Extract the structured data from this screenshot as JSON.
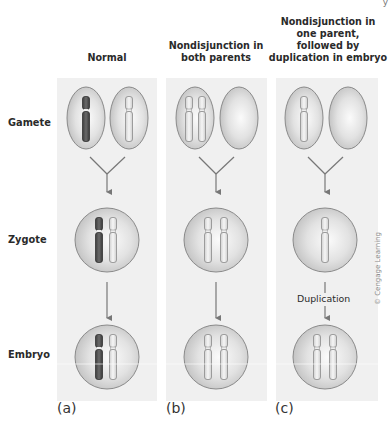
{
  "figure": {
    "top_right_fragment": "y",
    "columns": [
      {
        "id": "a",
        "title": "Normal",
        "panel_label": "(a)"
      },
      {
        "id": "b",
        "title": "Nondisjunction in both parents",
        "title_lines": [
          "Nondisjunction in",
          "both parents"
        ],
        "panel_label": "(b)"
      },
      {
        "id": "c",
        "title": "Nondisjunction in one parent, followed by duplication in embryo",
        "title_lines": [
          "Nondisjunction in",
          "one parent,",
          "followed by",
          "duplication in embryo"
        ],
        "panel_label": "(c)"
      }
    ],
    "rows": [
      {
        "id": "gamete",
        "label": "Gamete"
      },
      {
        "id": "zygote",
        "label": "Zygote"
      },
      {
        "id": "embryo",
        "label": "Embryo"
      }
    ],
    "annotations": {
      "duplication": "Duplication"
    },
    "credit": "© Cengage Learning",
    "colors": {
      "panel_bg": "#f0f0f0",
      "cell_fill": "#d8d8d8",
      "cell_stroke": "#8a8a8a",
      "dark_chromosome": "#555555",
      "light_chromosome": "#e8e8e8",
      "arrow": "#777777"
    }
  }
}
